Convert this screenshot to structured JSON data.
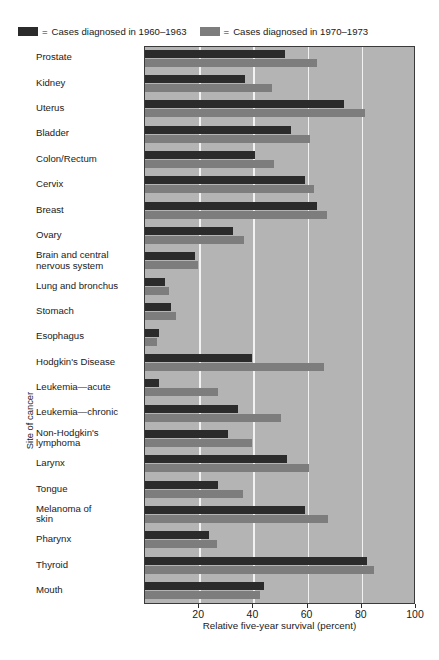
{
  "legend": {
    "equals": "=",
    "entries": [
      {
        "label": "Cases diagnosed in 1960–1963",
        "color": "#2b2b2b",
        "swatch_name": "legend-swatch-1960"
      },
      {
        "label": "Cases diagnosed in 1970–1973",
        "color": "#7d7d7d",
        "swatch_name": "legend-swatch-1970"
      }
    ]
  },
  "axes": {
    "y_title": "Site of cancer",
    "x_title": "Relative five-year survival (percent)",
    "x_ticks": [
      20,
      40,
      60,
      80,
      100
    ],
    "x_tick_labels": [
      "20",
      "40",
      "60",
      "80",
      "100"
    ],
    "x_min": 0,
    "x_max": 100
  },
  "colors": {
    "plot_background": "#b4b4b4",
    "gridline": "#f2f2f2",
    "series_old": "#2b2b2b",
    "series_new": "#7d7d7d",
    "frame": "#3a3a3a"
  },
  "chart_data": {
    "type": "bar",
    "orientation": "horizontal",
    "title": "",
    "subtitle": "",
    "xlabel": "Relative five-year survival (percent)",
    "ylabel": "Site of cancer",
    "xlim": [
      0,
      100
    ],
    "grid": true,
    "grid_axis": "x",
    "legend_position": "top-left",
    "categories": [
      "Prostate",
      "Kidney",
      "Uterus",
      "Bladder",
      "Colon/Rectum",
      "Cervix",
      "Breast",
      "Ovary",
      "Brain and central\nnervous system",
      "Lung and bronchus",
      "Stomach",
      "Esophagus",
      "Hodgkin's Disease",
      "Leukemia—acute",
      "Leukemia—chronic",
      "Non-Hodgkin's\nlymphoma",
      "Larynx",
      "Tongue",
      "Melanoma of\nskin",
      "Pharynx",
      "Thyroid",
      "Mouth"
    ],
    "series": [
      {
        "name": "Cases diagnosed in 1960–1963",
        "color": "#2b2b2b",
        "values": [
          51.5,
          37,
          73.5,
          54,
          40.5,
          59,
          63.5,
          32.5,
          18.5,
          7.5,
          9.5,
          5,
          39.5,
          5,
          34.5,
          30.5,
          52.5,
          27,
          59,
          23.5,
          82,
          44
        ]
      },
      {
        "name": "Cases diagnosed in 1970–1973",
        "color": "#7d7d7d",
        "values": [
          63.5,
          47,
          81,
          61,
          47.5,
          62.5,
          67,
          36.5,
          19.5,
          9,
          11.5,
          4.5,
          66,
          27,
          50,
          39.5,
          60.5,
          36,
          67.5,
          26.5,
          84.5,
          42.5
        ]
      }
    ]
  }
}
